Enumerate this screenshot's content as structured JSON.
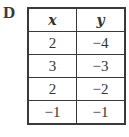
{
  "option_label": "D",
  "table": {
    "headers": [
      "x",
      "y"
    ],
    "rows": [
      [
        "2",
        "−4"
      ],
      [
        "3",
        "−3"
      ],
      [
        "2",
        "−2"
      ],
      [
        "−1",
        "−1"
      ]
    ]
  }
}
